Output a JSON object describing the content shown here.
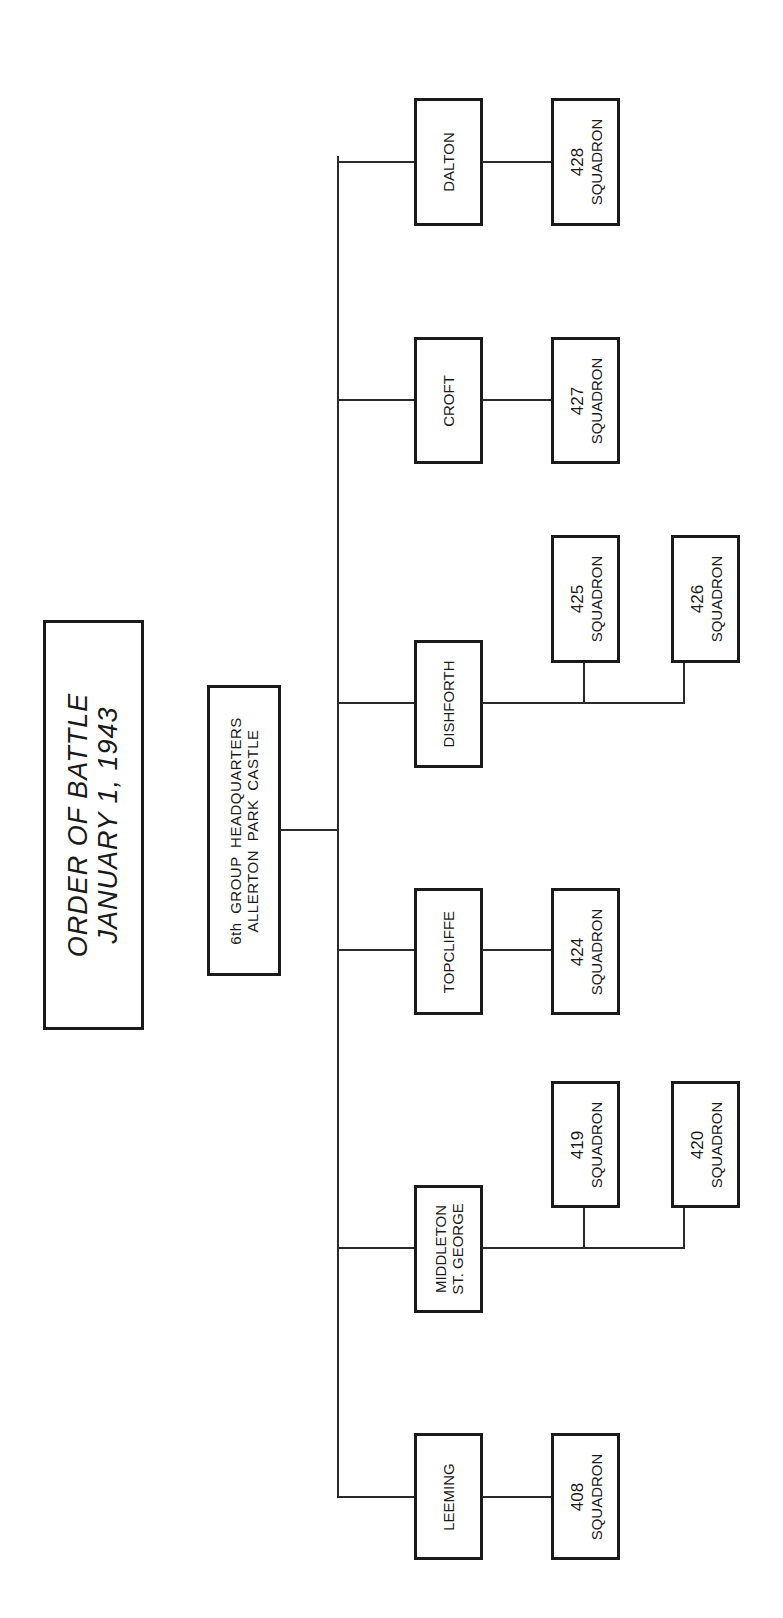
{
  "title": {
    "line1": "ORDER OF BATTLE",
    "line2": "JANUARY 1, 1943"
  },
  "headquarters": {
    "line1": "6th GROUP HEADQUARTERS",
    "line2": "ALLERTON PARK CASTLE"
  },
  "stations": [
    {
      "name": "DALTON",
      "squadrons": [
        {
          "number": "428",
          "label": "SQUADRON"
        }
      ]
    },
    {
      "name": "CROFT",
      "squadrons": [
        {
          "number": "427",
          "label": "SQUADRON"
        }
      ]
    },
    {
      "name": "DISHFORTH",
      "squadrons": [
        {
          "number": "425",
          "label": "SQUADRON"
        },
        {
          "number": "426",
          "label": "SQUADRON"
        }
      ]
    },
    {
      "name": "TOPCLIFFE",
      "squadrons": [
        {
          "number": "424",
          "label": "SQUADRON"
        }
      ]
    },
    {
      "name_line1": "MIDDLETON",
      "name_line2": "ST. GEORGE",
      "squadrons": [
        {
          "number": "419",
          "label": "SQUADRON"
        },
        {
          "number": "420",
          "label": "SQUADRON"
        }
      ]
    },
    {
      "name": "LEEMING",
      "squadrons": [
        {
          "number": "408",
          "label": "SQUADRON"
        }
      ]
    }
  ]
}
